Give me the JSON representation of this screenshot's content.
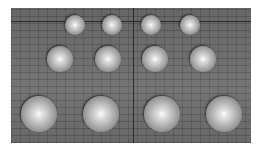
{
  "scene": {
    "description": "3D render of 12 shaded spheres arranged in three rows of four on a gray grid plane",
    "background_color": "#6c6c6c",
    "sphere_color": "#c8c8c8",
    "rows": [
      {
        "row": 1,
        "spheres": [
          {
            "cx": 75,
            "cy": 25,
            "r": 10
          },
          {
            "cx": 112,
            "cy": 25,
            "r": 10
          },
          {
            "cx": 151,
            "cy": 25,
            "r": 10
          },
          {
            "cx": 190,
            "cy": 25,
            "r": 10
          }
        ]
      },
      {
        "row": 2,
        "spheres": [
          {
            "cx": 60,
            "cy": 59,
            "r": 13
          },
          {
            "cx": 108,
            "cy": 59,
            "r": 13
          },
          {
            "cx": 155,
            "cy": 59,
            "r": 13
          },
          {
            "cx": 203,
            "cy": 59,
            "r": 13
          }
        ]
      },
      {
        "row": 3,
        "spheres": [
          {
            "cx": 39,
            "cy": 114,
            "r": 18
          },
          {
            "cx": 101,
            "cy": 114,
            "r": 18
          },
          {
            "cx": 162,
            "cy": 114,
            "r": 18
          },
          {
            "cx": 224,
            "cy": 114,
            "r": 18
          }
        ]
      }
    ]
  }
}
